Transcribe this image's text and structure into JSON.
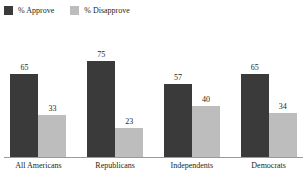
{
  "chart_data": {
    "type": "bar",
    "title": "",
    "xlabel": "",
    "ylabel": "",
    "ylim": [
      0,
      100
    ],
    "grid": false,
    "legend_position": "top-left",
    "categories": [
      "All Americans",
      "Republicans",
      "Independents",
      "Democrats"
    ],
    "series": [
      {
        "name": "% Approve",
        "color": "#3a3a3a",
        "values": [
          65,
          75,
          57,
          65
        ]
      },
      {
        "name": "% Disapprove",
        "color": "#bdbdbd",
        "values": [
          33,
          23,
          40,
          34
        ]
      }
    ]
  },
  "legend": {
    "items": [
      {
        "label": "% Approve",
        "swatch_name": "legend-swatch-approve"
      },
      {
        "label": "% Disapprove",
        "swatch_name": "legend-swatch-disapprove"
      }
    ]
  },
  "axis": {
    "baseline_color": "#9a9a9a"
  }
}
